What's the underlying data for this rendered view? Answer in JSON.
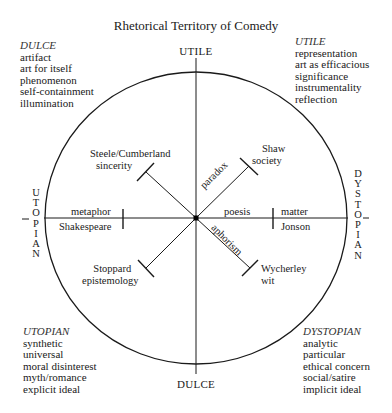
{
  "title": "Rhetorical Territory of Comedy",
  "axes": {
    "top": "UTILE",
    "bottom": "DULCE",
    "left": [
      "U",
      "T",
      "O",
      "P",
      "I",
      "A",
      "N"
    ],
    "right": [
      "D",
      "Y",
      "S",
      "T",
      "O",
      "P",
      "I",
      "A",
      "N"
    ]
  },
  "corners": {
    "top_left": {
      "heading": "DULCE",
      "items": [
        "artifact",
        "art for itself",
        "phenomenon",
        "self-containment",
        "illumination"
      ]
    },
    "top_right": {
      "heading": "UTILE",
      "items": [
        "representation",
        "art as efficacious",
        "significance",
        "instrumentality",
        "reflection"
      ]
    },
    "bottom_left": {
      "heading": "UTOPIAN",
      "items": [
        "synthetic",
        "universal",
        "moral disinterest",
        "myth/romance",
        "explicit ideal"
      ]
    },
    "bottom_right": {
      "heading": "DYSTOPIAN",
      "items": [
        "analytic",
        "particular",
        "ethical concern",
        "social/satire",
        "implicit ideal"
      ]
    }
  },
  "arms": {
    "upper_left": {
      "author": "Steele/Cumberland",
      "quality": "sincerity"
    },
    "upper_right": {
      "author": "Shaw",
      "quality": "society",
      "mode": "paradox"
    },
    "left": {
      "mode": "metaphor",
      "author": "Shakespeare"
    },
    "right": {
      "mode": "poesis",
      "quality": "matter",
      "author": "Jonson"
    },
    "lower_right": {
      "author": "Wycherley",
      "quality": "wit",
      "mode": "aphorism"
    },
    "lower_left": {
      "author": "Stoppard",
      "quality": "epistemology"
    }
  },
  "colors": {
    "ink": "#1a1a1a",
    "background": "#ffffff"
  }
}
